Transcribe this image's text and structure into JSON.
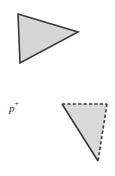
{
  "figure": {
    "background_color": "#ffffff",
    "width": 115,
    "height": 176,
    "shapes": [
      {
        "id": "upper-triangle",
        "name": "upper-triangle",
        "kind": "triangle",
        "fill": "#d6d6d6",
        "stroke": "#3a3a3a",
        "stroke_width": 1.6,
        "edge_style": "solid",
        "points": "18,14 78,32 20,63",
        "vertices": [
          {
            "x": 18,
            "y": 14
          },
          {
            "x": 78,
            "y": 32
          },
          {
            "x": 20,
            "y": 63
          }
        ]
      },
      {
        "id": "lower-triangle",
        "name": "lower-triangle",
        "kind": "triangle",
        "fill": "#d9d9d9",
        "stroke": "#3a3a3a",
        "stroke_width": 1.6,
        "edge_style": "mixed",
        "points": "62,104 107,104 98,161",
        "vertices": [
          {
            "x": 62,
            "y": 104
          },
          {
            "x": 107,
            "y": 104
          },
          {
            "x": 98,
            "y": 161
          }
        ],
        "edges": [
          {
            "id": "top-edge",
            "from": [
              62,
              104
            ],
            "to": [
              107,
              104
            ],
            "style": "dashed",
            "dash": "3.2,2.2"
          },
          {
            "id": "right-edge",
            "from": [
              107,
              104
            ],
            "to": [
              98,
              161
            ],
            "style": "dashed",
            "dash": "3.2,2.2"
          },
          {
            "id": "left-edge",
            "from": [
              98,
              161
            ],
            "to": [
              62,
              104
            ],
            "style": "solid",
            "dash": ""
          }
        ]
      }
    ],
    "labels": [
      {
        "id": "point-label-p",
        "name": "point-label-p",
        "base": "p",
        "superscript": "+",
        "x": 9,
        "y": 101,
        "color": "#2b2b2b",
        "italic": true
      }
    ]
  }
}
